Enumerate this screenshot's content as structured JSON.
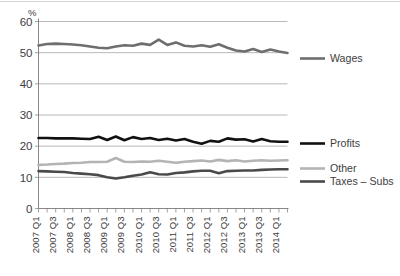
{
  "chart_data": {
    "type": "line",
    "title": "",
    "xlabel": "",
    "ylabel": "",
    "yunit": "%",
    "ylim": [
      0,
      60
    ],
    "yticks": [
      0,
      10,
      20,
      30,
      40,
      50,
      60
    ],
    "grid": "horizontal",
    "legend_position": "right",
    "x": [
      "2007 Q1",
      "2007 Q2",
      "2007 Q3",
      "2007 Q4",
      "2008 Q1",
      "2008 Q2",
      "2008 Q3",
      "2008 Q4",
      "2009 Q1",
      "2009 Q2",
      "2009 Q3",
      "2009 Q4",
      "2010 Q1",
      "2010 Q2",
      "2010 Q3",
      "2010 Q4",
      "2011 Q1",
      "2011 Q2",
      "2011 Q3",
      "2011 Q4",
      "2012 Q1",
      "2012 Q2",
      "2012 Q3",
      "2012 Q4",
      "2013 Q1",
      "2013 Q2",
      "2013 Q3",
      "2013 Q4",
      "2014 Q1",
      "2014 Q2"
    ],
    "xtick_labels": [
      "2007 Q1",
      "2007 Q3",
      "2008 Q1",
      "2008 Q3",
      "2009 Q1",
      "2009 Q3",
      "2010 Q1",
      "2010 Q3",
      "2011 Q1",
      "2011 Q3",
      "2012 Q1",
      "2012 Q3",
      "2013 Q1",
      "2013 Q3",
      "2014 Q1"
    ],
    "xtick_indices": [
      0,
      2,
      4,
      6,
      8,
      10,
      12,
      14,
      16,
      18,
      20,
      22,
      24,
      26,
      28
    ],
    "series": [
      {
        "name": "Wages",
        "color": "#6e6e6e",
        "width": 2.6,
        "values": [
          52.3,
          52.8,
          52.9,
          52.8,
          52.6,
          52.4,
          52.0,
          51.6,
          51.4,
          52.0,
          52.4,
          52.2,
          52.9,
          52.5,
          54.2,
          52.5,
          53.3,
          52.2,
          52.0,
          52.4,
          51.9,
          52.7,
          51.6,
          50.7,
          50.4,
          51.2,
          50.2,
          51.0,
          50.4,
          49.9
        ]
      },
      {
        "name": "Profits",
        "color": "#111111",
        "width": 2.6,
        "values": [
          22.6,
          22.6,
          22.5,
          22.5,
          22.5,
          22.4,
          22.3,
          23.0,
          22.0,
          23.1,
          21.9,
          22.9,
          22.3,
          22.6,
          22.0,
          22.4,
          21.8,
          22.3,
          21.4,
          20.8,
          21.7,
          21.4,
          22.5,
          22.1,
          22.2,
          21.5,
          22.3,
          21.6,
          21.4,
          21.4
        ]
      },
      {
        "name": "Other",
        "color": "#b4b4b4",
        "width": 2.6,
        "values": [
          14.0,
          14.1,
          14.3,
          14.4,
          14.6,
          14.7,
          14.9,
          14.9,
          15.0,
          16.2,
          15.0,
          14.9,
          15.1,
          15.0,
          15.3,
          15.0,
          14.7,
          15.0,
          15.2,
          15.4,
          15.1,
          15.6,
          15.2,
          15.5,
          15.1,
          15.3,
          15.5,
          15.3,
          15.4,
          15.5
        ]
      },
      {
        "name": "Taxes – Subs",
        "color": "#4a4a4a",
        "width": 2.6,
        "values": [
          12.0,
          11.9,
          11.8,
          11.7,
          11.4,
          11.2,
          11.0,
          10.7,
          10.0,
          9.6,
          10.0,
          10.5,
          10.9,
          11.6,
          11.0,
          10.9,
          11.4,
          11.6,
          11.9,
          12.1,
          12.1,
          11.3,
          12.0,
          12.1,
          12.2,
          12.2,
          12.4,
          12.5,
          12.6,
          12.6
        ]
      }
    ]
  },
  "legend": {
    "items": [
      {
        "label": "Wages"
      },
      {
        "label": "Profits"
      },
      {
        "label": "Other"
      },
      {
        "label": "Taxes – Subs"
      }
    ]
  }
}
